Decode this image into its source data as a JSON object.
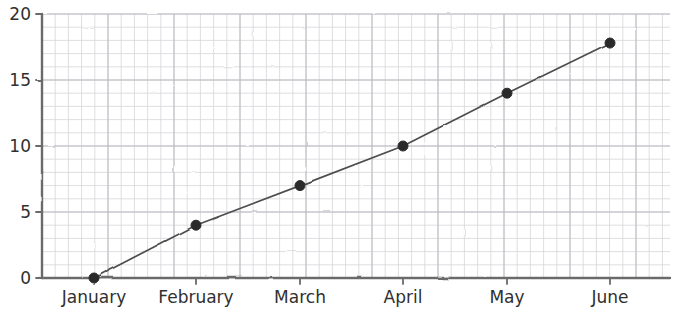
{
  "chart_data": {
    "type": "line",
    "title": "",
    "subtitle": "",
    "xlabel": "",
    "ylabel": "",
    "categories": [
      "January",
      "February",
      "March",
      "April",
      "May",
      "June"
    ],
    "values": [
      0,
      4,
      7,
      10,
      14,
      17.8
    ],
    "series": [
      {
        "name": "",
        "values": [
          0,
          4,
          7,
          10,
          14,
          17.8
        ]
      }
    ],
    "ylim": [
      0,
      20
    ],
    "xlim": [
      0,
      5
    ],
    "yticks": [
      0,
      5,
      10,
      15,
      20
    ],
    "ytick_labels": [
      "0",
      "5",
      "10",
      "15",
      "20"
    ],
    "xtick_labels": [
      "January",
      "February",
      "March",
      "April",
      "May",
      "June"
    ],
    "grid": true,
    "grid_minor": true,
    "legend": false,
    "legend_position": "none",
    "style": "xkcd-sketch",
    "marker": "circle",
    "line_color": "#4d4d4d",
    "marker_color": "#2b2b2b",
    "grid_color": "#c8c8cd",
    "axis_color": "#6b6b6b",
    "background": "#ffffff",
    "annotations": []
  },
  "axes": {
    "y_axis_name": "y-axis",
    "x_axis_name": "x-axis"
  }
}
